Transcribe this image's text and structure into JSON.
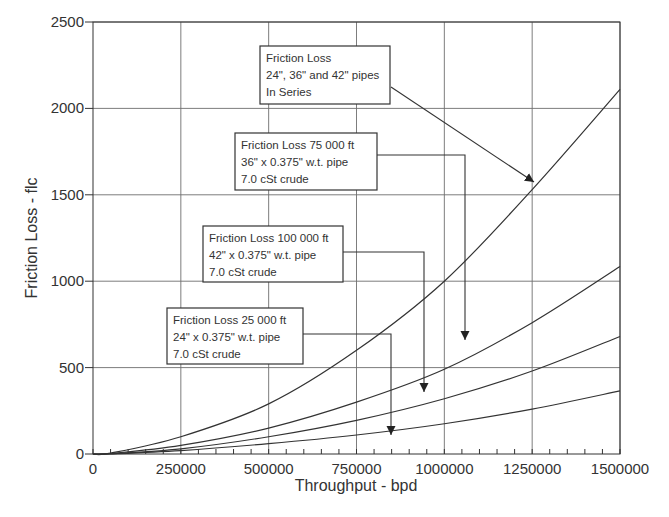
{
  "chart_data": {
    "type": "line",
    "title": "",
    "xlabel": "Throughput - bpd",
    "ylabel": "Friction Loss - flc",
    "xlim": [
      0,
      1500000
    ],
    "ylim": [
      0,
      2500
    ],
    "x_ticks": [
      0,
      250000,
      500000,
      750000,
      1000000,
      1250000,
      1500000
    ],
    "x_tick_labels": [
      "0",
      "250000",
      "500000",
      "750000",
      "1000000",
      "1250000",
      "1500000"
    ],
    "x_minor_tick_step": 50000,
    "y_ticks": [
      0,
      500,
      1000,
      1500,
      2000,
      2500
    ],
    "y_tick_labels": [
      "0",
      "500",
      "1000",
      "1500",
      "2000",
      "2500"
    ],
    "grid": true,
    "legend": "none (callout annotations)",
    "x": [
      0,
      50000,
      250000,
      500000,
      750000,
      1000000,
      1250000,
      1500000
    ],
    "series": [
      {
        "name": "Friction Loss 24\", 36\" and 42\" pipes In Series",
        "values": [
          0,
          5,
          100,
          290,
          600,
          1000,
          1530,
          2110
        ]
      },
      {
        "name": "Friction Loss 75 000 ft 36\" x 0.375\" w.t. pipe 7.0 cSt crude",
        "values": [
          0,
          3,
          50,
          150,
          300,
          490,
          760,
          1085
        ]
      },
      {
        "name": "Friction Loss 100 000 ft 42\" x 0.375\" w.t. pipe 7.0 cSt crude",
        "values": [
          0,
          2,
          30,
          100,
          195,
          320,
          480,
          680
        ]
      },
      {
        "name": "Friction Loss 25 000 ft 24\" x 0.375\" w.t. pipe 7.0 cSt crude",
        "values": [
          0,
          1,
          20,
          60,
          110,
          175,
          260,
          365
        ]
      }
    ],
    "annotations": [
      {
        "lines": [
          "Friction Loss",
          "24\", 36\" and 42\" pipes",
          "In Series"
        ],
        "points_to_series": 0
      },
      {
        "lines": [
          "Friction Loss  75 000 ft",
          "36\" x 0.375\" w.t. pipe",
          "7.0 cSt crude"
        ],
        "points_to_series": 1
      },
      {
        "lines": [
          "Friction Loss 100 000 ft",
          "42\" x 0.375\" w.t. pipe",
          "7.0 cSt crude"
        ],
        "points_to_series": 2
      },
      {
        "lines": [
          "Friction Loss 25 000 ft",
          "24\" x 0.375\" w.t. pipe",
          "7.0 cSt crude"
        ],
        "points_to_series": 3
      }
    ]
  },
  "colors": {
    "line": "#333333",
    "grid": "#6e6e6e",
    "text": "#333333",
    "background": "#ffffff"
  }
}
